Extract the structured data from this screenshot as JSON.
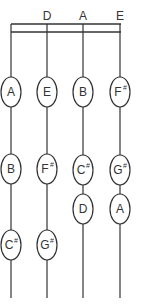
{
  "diagram": {
    "type": "string-fingerboard-chart",
    "strings": [
      {
        "label": "",
        "notes": [
          {
            "name": "A",
            "accidental": ""
          },
          {
            "name": "B",
            "accidental": ""
          },
          {
            "name": "C",
            "accidental": "#"
          }
        ]
      },
      {
        "label": "D",
        "notes": [
          {
            "name": "E",
            "accidental": ""
          },
          {
            "name": "F",
            "accidental": "#"
          },
          {
            "name": "G",
            "accidental": "#"
          }
        ]
      },
      {
        "label": "A",
        "notes": [
          {
            "name": "B",
            "accidental": ""
          },
          {
            "name": "C",
            "accidental": "#"
          },
          {
            "name": "D",
            "accidental": ""
          }
        ]
      },
      {
        "label": "E",
        "notes": [
          {
            "name": "F",
            "accidental": "#"
          },
          {
            "name": "G",
            "accidental": "#"
          },
          {
            "name": "A",
            "accidental": ""
          }
        ]
      }
    ]
  }
}
